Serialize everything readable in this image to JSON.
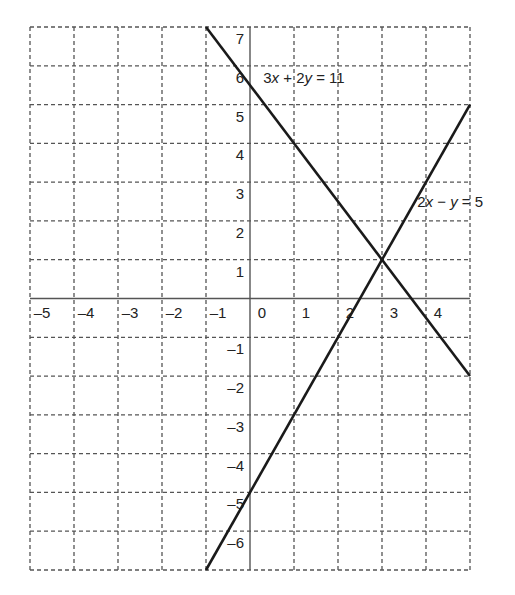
{
  "chart_data": {
    "type": "line",
    "title": "",
    "xlabel": "",
    "ylabel": "",
    "xlim": [
      -5,
      5
    ],
    "ylim": [
      -7,
      7
    ],
    "grid": true,
    "grid_style": "dashed",
    "x_ticks": [
      -5,
      -4,
      -3,
      -2,
      -1,
      0,
      1,
      2,
      3,
      4
    ],
    "x_tick_labels": [
      "–5",
      "–4",
      "–3",
      "–2",
      "–1",
      "0",
      "1",
      "2",
      "3",
      "4"
    ],
    "y_ticks": [
      7,
      6,
      5,
      4,
      3,
      2,
      1,
      -1,
      -2,
      -3,
      -4,
      -5,
      -6
    ],
    "y_tick_labels": [
      "7",
      "6",
      "5",
      "4",
      "3",
      "2",
      "1",
      "–1",
      "–2",
      "–3",
      "–4",
      "–5",
      "–6"
    ],
    "series": [
      {
        "name": "3x + 2y = 11",
        "label_parts": [
          "3",
          "x",
          " + 2",
          "y",
          " = 11"
        ],
        "equation": "y = (11 - 3x) / 2",
        "x": [
          -1,
          5
        ],
        "y": [
          7,
          -2
        ],
        "color": "#1a1a1a"
      },
      {
        "name": "2x − y = 5",
        "label_parts": [
          "2",
          "x",
          " − ",
          "y",
          " = 5"
        ],
        "equation": "y = 2x - 5",
        "x": [
          -1,
          5
        ],
        "y": [
          -7,
          5
        ],
        "color": "#1a1a1a"
      }
    ],
    "intersection": {
      "x": 3,
      "y": 1
    },
    "annotations": [
      {
        "text": "3x + 2y = 11",
        "x": 0.3,
        "y": 5.55
      },
      {
        "text": "2x − y = 5",
        "x": 3.8,
        "y": 2.35
      }
    ]
  },
  "style": {
    "grid_color": "#555555",
    "axis_color": "#555555",
    "line_color": "#1a1a1a",
    "background": "#ffffff"
  }
}
